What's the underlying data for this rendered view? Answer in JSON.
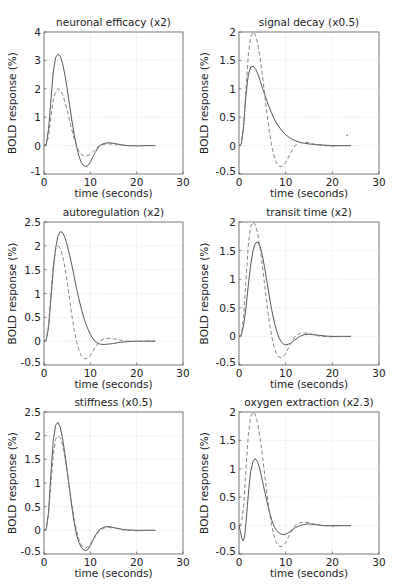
{
  "figure": {
    "xlabel": "time (seconds)",
    "ylabel": "BOLD response (%)"
  },
  "chart_data": [
    {
      "type": "line",
      "title": "neuronal efficacy (x2)",
      "xlabel": "time (seconds)",
      "ylabel": "BOLD response (%)",
      "xlim": [
        0,
        30
      ],
      "ylim": [
        -1,
        4
      ],
      "xticks": [
        0,
        10,
        20,
        30
      ],
      "yticks": [
        -1,
        0,
        1,
        2,
        3,
        4
      ],
      "ytick_labels": [
        "-1",
        "0",
        "1",
        "2",
        "3",
        "4"
      ],
      "grid": true,
      "series": [
        {
          "name": "modified",
          "style": "solid",
          "x": [
            0,
            0.5,
            1,
            1.5,
            2,
            2.5,
            3,
            3.5,
            4,
            4.5,
            5,
            5.5,
            6,
            6.5,
            7,
            7.5,
            8,
            8.5,
            9,
            9.5,
            10,
            10.5,
            11,
            12,
            13,
            14,
            15,
            16,
            17,
            18,
            20,
            22,
            24
          ],
          "y": [
            0,
            0.05,
            0.6,
            1.6,
            2.6,
            3.1,
            3.22,
            3.15,
            2.9,
            2.5,
            2.0,
            1.45,
            0.9,
            0.4,
            0,
            -0.35,
            -0.58,
            -0.7,
            -0.73,
            -0.7,
            -0.58,
            -0.42,
            -0.25,
            0,
            0.08,
            0.1,
            0.08,
            0.05,
            0.02,
            0,
            -0.01,
            0,
            0
          ]
        },
        {
          "name": "baseline",
          "style": "dashed",
          "x": [
            0,
            0.5,
            1,
            1.5,
            2,
            2.5,
            3,
            3.5,
            4,
            4.5,
            5,
            5.5,
            6,
            6.5,
            7,
            7.5,
            8,
            8.5,
            9,
            9.5,
            10,
            10.5,
            11,
            12,
            13,
            14,
            15,
            16,
            17,
            18,
            20,
            22,
            24
          ],
          "y": [
            0,
            0.03,
            0.35,
            1.0,
            1.6,
            1.92,
            2.0,
            1.95,
            1.8,
            1.55,
            1.25,
            0.9,
            0.55,
            0.25,
            0,
            -0.18,
            -0.3,
            -0.36,
            -0.37,
            -0.35,
            -0.3,
            -0.22,
            -0.14,
            0,
            0.05,
            0.06,
            0.05,
            0.03,
            0.01,
            0,
            -0.01,
            0,
            0
          ]
        }
      ]
    },
    {
      "type": "line",
      "title": "signal decay (x0.5)",
      "xlabel": "time (seconds)",
      "ylabel": "BOLD response (%)",
      "xlim": [
        0,
        30
      ],
      "ylim": [
        -0.5,
        2
      ],
      "xticks": [
        0,
        10,
        20,
        30
      ],
      "yticks": [
        -0.5,
        0,
        0.5,
        1,
        1.5,
        2
      ],
      "ytick_labels": [
        "-0.5",
        "0",
        "0.5",
        "1",
        "1.5",
        "2"
      ],
      "grid": true,
      "annotations": [
        {
          "type": "point",
          "x": 23.2,
          "y": 0.18
        }
      ],
      "series": [
        {
          "name": "modified",
          "style": "solid",
          "x": [
            0,
            0.5,
            1,
            1.5,
            2,
            2.5,
            3,
            3.5,
            4,
            4.5,
            5,
            5.5,
            6,
            6.5,
            7,
            7.5,
            8,
            9,
            10,
            11,
            12,
            13,
            14,
            15,
            16,
            18,
            20,
            22,
            24
          ],
          "y": [
            0,
            0.03,
            0.35,
            0.9,
            1.25,
            1.38,
            1.4,
            1.36,
            1.27,
            1.15,
            1.02,
            0.9,
            0.78,
            0.67,
            0.57,
            0.48,
            0.4,
            0.28,
            0.19,
            0.13,
            0.09,
            0.06,
            0.04,
            0.03,
            0.02,
            0.01,
            0,
            0,
            0
          ]
        },
        {
          "name": "baseline",
          "style": "dashed",
          "x": [
            0,
            0.5,
            1,
            1.5,
            2,
            2.5,
            3,
            3.5,
            4,
            4.5,
            5,
            5.5,
            6,
            6.5,
            7,
            7.5,
            8,
            8.5,
            9,
            9.5,
            10,
            10.5,
            11,
            12,
            13,
            14,
            15,
            16,
            17,
            18,
            20,
            22,
            24
          ],
          "y": [
            0,
            0.03,
            0.35,
            1.0,
            1.6,
            1.92,
            2.0,
            1.95,
            1.8,
            1.55,
            1.25,
            0.9,
            0.55,
            0.25,
            0,
            -0.18,
            -0.3,
            -0.36,
            -0.37,
            -0.35,
            -0.3,
            -0.22,
            -0.14,
            0,
            0.05,
            0.06,
            0.05,
            0.03,
            0.01,
            0,
            -0.01,
            0,
            0
          ]
        }
      ]
    },
    {
      "type": "line",
      "title": "autoregulation (x2)",
      "xlabel": "time (seconds)",
      "ylabel": "BOLD response (%)",
      "xlim": [
        0,
        30
      ],
      "ylim": [
        -0.5,
        2.5
      ],
      "xticks": [
        0,
        10,
        20,
        30
      ],
      "yticks": [
        -0.5,
        0,
        0.5,
        1,
        1.5,
        2,
        2.5
      ],
      "ytick_labels": [
        "-0.5",
        "0",
        "0.5",
        "1",
        "1.5",
        "2",
        "2.5"
      ],
      "grid": true,
      "series": [
        {
          "name": "modified",
          "style": "solid",
          "x": [
            0,
            0.5,
            1,
            1.5,
            2,
            2.5,
            3,
            3.5,
            4,
            4.5,
            5,
            5.5,
            6,
            6.5,
            7,
            7.5,
            8,
            8.5,
            9,
            9.5,
            10,
            10.5,
            11,
            11.5,
            12,
            13,
            14,
            15,
            16,
            17,
            18,
            20,
            22,
            24
          ],
          "y": [
            0,
            0.02,
            0.3,
            0.9,
            1.5,
            1.95,
            2.2,
            2.3,
            2.28,
            2.18,
            2.02,
            1.82,
            1.6,
            1.36,
            1.12,
            0.9,
            0.7,
            0.52,
            0.37,
            0.25,
            0.14,
            0.06,
            0,
            -0.04,
            -0.06,
            -0.07,
            -0.06,
            -0.05,
            -0.03,
            -0.02,
            -0.01,
            0,
            0,
            0
          ]
        },
        {
          "name": "baseline",
          "style": "dashed",
          "x": [
            0,
            0.5,
            1,
            1.5,
            2,
            2.5,
            3,
            3.5,
            4,
            4.5,
            5,
            5.5,
            6,
            6.5,
            7,
            7.5,
            8,
            8.5,
            9,
            9.5,
            10,
            10.5,
            11,
            12,
            13,
            14,
            15,
            16,
            17,
            18,
            20,
            22,
            24
          ],
          "y": [
            0,
            0.03,
            0.35,
            1.0,
            1.6,
            1.92,
            2.0,
            1.95,
            1.8,
            1.55,
            1.25,
            0.9,
            0.55,
            0.25,
            0,
            -0.18,
            -0.3,
            -0.36,
            -0.37,
            -0.35,
            -0.3,
            -0.22,
            -0.14,
            0,
            0.05,
            0.06,
            0.05,
            0.03,
            0.01,
            0,
            -0.01,
            0,
            0
          ]
        }
      ]
    },
    {
      "type": "line",
      "title": "transit time (x2)",
      "xlabel": "time (seconds)",
      "ylabel": "BOLD response (%)",
      "xlim": [
        0,
        30
      ],
      "ylim": [
        -0.5,
        2
      ],
      "xticks": [
        0,
        10,
        20,
        30
      ],
      "yticks": [
        -0.5,
        0,
        0.5,
        1,
        1.5,
        2
      ],
      "ytick_labels": [
        "-0.5",
        "0",
        "0.5",
        "1",
        "1.5",
        "2"
      ],
      "grid": true,
      "series": [
        {
          "name": "modified",
          "style": "solid",
          "x": [
            0,
            0.5,
            1,
            1.5,
            2,
            2.5,
            3,
            3.5,
            4,
            4.5,
            5,
            5.5,
            6,
            6.5,
            7,
            7.5,
            8,
            8.5,
            9,
            9.5,
            10,
            10.5,
            11,
            12,
            13,
            14,
            15,
            16,
            17,
            18,
            20,
            22,
            24
          ],
          "y": [
            0,
            0.02,
            0.2,
            0.5,
            0.9,
            1.25,
            1.5,
            1.63,
            1.65,
            1.58,
            1.42,
            1.2,
            0.95,
            0.7,
            0.47,
            0.27,
            0.11,
            -0.01,
            -0.09,
            -0.13,
            -0.15,
            -0.14,
            -0.12,
            -0.06,
            0,
            0.03,
            0.04,
            0.03,
            0.02,
            0.01,
            0,
            0,
            0
          ]
        },
        {
          "name": "baseline",
          "style": "dashed",
          "x": [
            0,
            0.5,
            1,
            1.5,
            2,
            2.5,
            3,
            3.5,
            4,
            4.5,
            5,
            5.5,
            6,
            6.5,
            7,
            7.5,
            8,
            8.5,
            9,
            9.5,
            10,
            10.5,
            11,
            12,
            13,
            14,
            15,
            16,
            17,
            18,
            20,
            22,
            24
          ],
          "y": [
            0,
            0.03,
            0.35,
            1.0,
            1.6,
            1.92,
            2.0,
            1.95,
            1.8,
            1.55,
            1.25,
            0.9,
            0.55,
            0.25,
            0,
            -0.18,
            -0.3,
            -0.36,
            -0.37,
            -0.35,
            -0.3,
            -0.22,
            -0.14,
            0,
            0.05,
            0.06,
            0.05,
            0.03,
            0.01,
            0,
            -0.01,
            0,
            0
          ]
        }
      ]
    },
    {
      "type": "line",
      "title": "stiffness (x0.5)",
      "xlabel": "time (seconds)",
      "ylabel": "BOLD response (%)",
      "xlim": [
        0,
        30
      ],
      "ylim": [
        -0.5,
        2.5
      ],
      "xticks": [
        0,
        10,
        20,
        30
      ],
      "yticks": [
        -0.5,
        0,
        0.5,
        1,
        1.5,
        2,
        2.5
      ],
      "ytick_labels": [
        "-0.5",
        "0",
        "0.5",
        "1",
        "1.5",
        "2",
        "2.5"
      ],
      "grid": true,
      "series": [
        {
          "name": "modified",
          "style": "solid",
          "x": [
            0,
            0.5,
            1,
            1.5,
            2,
            2.5,
            3,
            3.5,
            4,
            4.5,
            5,
            5.5,
            6,
            6.5,
            7,
            7.5,
            8,
            8.5,
            9,
            9.5,
            10,
            10.5,
            11,
            12,
            13,
            14,
            15,
            16,
            17,
            18,
            20,
            22,
            24
          ],
          "y": [
            0,
            0.03,
            0.4,
            1.2,
            1.9,
            2.22,
            2.28,
            2.18,
            1.95,
            1.62,
            1.25,
            0.88,
            0.5,
            0.18,
            -0.08,
            -0.25,
            -0.35,
            -0.41,
            -0.43,
            -0.4,
            -0.32,
            -0.22,
            -0.12,
            0.02,
            0.07,
            0.08,
            0.06,
            0.04,
            0.02,
            0.01,
            0,
            0,
            0
          ]
        },
        {
          "name": "baseline",
          "style": "dashed",
          "x": [
            0,
            0.5,
            1,
            1.5,
            2,
            2.5,
            3,
            3.5,
            4,
            4.5,
            5,
            5.5,
            6,
            6.5,
            7,
            7.5,
            8,
            8.5,
            9,
            9.5,
            10,
            10.5,
            11,
            12,
            13,
            14,
            15,
            16,
            17,
            18,
            20,
            22,
            24
          ],
          "y": [
            0,
            0.03,
            0.35,
            1.0,
            1.6,
            1.92,
            2.0,
            1.95,
            1.8,
            1.55,
            1.25,
            0.9,
            0.55,
            0.25,
            0,
            -0.18,
            -0.3,
            -0.36,
            -0.37,
            -0.35,
            -0.3,
            -0.22,
            -0.14,
            0,
            0.05,
            0.06,
            0.05,
            0.03,
            0.01,
            0,
            -0.01,
            0,
            0
          ]
        }
      ]
    },
    {
      "type": "line",
      "title": "oxygen extraction (x2.3)",
      "xlabel": "time (seconds)",
      "ylabel": "BOLD response (%)",
      "xlim": [
        0,
        30
      ],
      "ylim": [
        -0.5,
        2
      ],
      "xticks": [
        0,
        10,
        20,
        30
      ],
      "yticks": [
        -0.5,
        0,
        0.5,
        1,
        1.5,
        2
      ],
      "ytick_labels": [
        "-0.5",
        "0",
        "0.5",
        "1",
        "1.5",
        "2"
      ],
      "grid": true,
      "series": [
        {
          "name": "modified",
          "style": "solid",
          "x": [
            0,
            0.3,
            0.6,
            0.9,
            1.2,
            1.5,
            1.8,
            2.1,
            2.5,
            3,
            3.5,
            4,
            4.5,
            5,
            5.5,
            6,
            6.5,
            7,
            7.5,
            8,
            8.5,
            9,
            9.5,
            10,
            10.5,
            11,
            12,
            13,
            14,
            15,
            16,
            17,
            18,
            20,
            22,
            24
          ],
          "y": [
            0,
            -0.1,
            -0.22,
            -0.27,
            -0.2,
            0.05,
            0.35,
            0.65,
            0.95,
            1.13,
            1.18,
            1.12,
            0.98,
            0.8,
            0.6,
            0.42,
            0.25,
            0.1,
            -0.01,
            -0.08,
            -0.12,
            -0.15,
            -0.16,
            -0.15,
            -0.13,
            -0.1,
            -0.04,
            0,
            0.02,
            0.03,
            0.02,
            0.01,
            0,
            0,
            0,
            0
          ]
        },
        {
          "name": "baseline",
          "style": "dashed",
          "x": [
            0,
            0.5,
            1,
            1.5,
            2,
            2.5,
            3,
            3.5,
            4,
            4.5,
            5,
            5.5,
            6,
            6.5,
            7,
            7.5,
            8,
            8.5,
            9,
            9.5,
            10,
            10.5,
            11,
            12,
            13,
            14,
            15,
            16,
            17,
            18,
            20,
            22,
            24
          ],
          "y": [
            0,
            0.03,
            0.35,
            1.0,
            1.6,
            1.92,
            2.0,
            1.95,
            1.8,
            1.55,
            1.25,
            0.9,
            0.55,
            0.25,
            0,
            -0.18,
            -0.3,
            -0.36,
            -0.37,
            -0.35,
            -0.3,
            -0.22,
            -0.14,
            0,
            0.05,
            0.06,
            0.05,
            0.03,
            0.01,
            0,
            -0.01,
            0,
            0
          ]
        }
      ]
    }
  ]
}
